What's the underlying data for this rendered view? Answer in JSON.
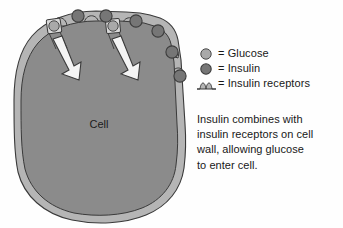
{
  "diagram": {
    "type": "biology-cell-diagram",
    "title_visible": false,
    "cell": {
      "label": "Cell",
      "membrane_color": "#b5b5b5",
      "cytoplasm_color": "#8b8b8b",
      "outline_color": "#3a3a3a"
    },
    "molecules": {
      "glucose": {
        "name": "Glucose",
        "color": "#a9a9a9",
        "outline": "#4a4a4a",
        "count_visible": 2
      },
      "insulin": {
        "name": "Insulin",
        "color": "#767676",
        "outline": "#3c3c3c",
        "count_visible": 6
      },
      "receptors": {
        "name": "Insulin receptors",
        "color": "#b5b5b5",
        "count_visible": 6
      }
    },
    "arrows": {
      "count": 2,
      "fill": "#f4f4f4",
      "outline": "#3a3a3a",
      "meaning": "glucose entering cell"
    }
  },
  "legend": {
    "items": [
      {
        "glyph": "glucose-circle-icon",
        "equals": "=",
        "label": "= Glucose"
      },
      {
        "glyph": "insulin-circle-icon",
        "equals": "=",
        "label": "= Insulin"
      },
      {
        "glyph": "insulin-receptor-icon",
        "equals": "=",
        "label": "= Insulin receptors"
      }
    ]
  },
  "caption": {
    "lines": [
      "Insulin combines with",
      "insulin receptors on cell",
      "wall, allowing glucose",
      "to enter cell."
    ],
    "text": "Insulin combines with insulin receptors on cell wall, allowing glucose to enter cell."
  },
  "colors": {
    "background": "#fefefe",
    "text": "#181818",
    "membrane_light": "#b5b5b5",
    "cytoplasm_dark": "#8b8b8b",
    "glucose": "#a9a9a9",
    "insulin": "#767676",
    "stroke": "#3a3a3a"
  }
}
